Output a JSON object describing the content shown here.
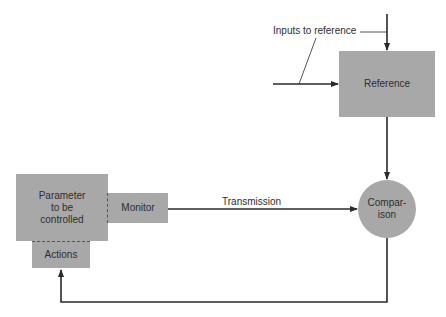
{
  "diagram": {
    "title": "",
    "colors": {
      "node_fill": "#a8a8a8",
      "line": "#2a2a2a",
      "text": "#2e2e2e",
      "background": "#ffffff"
    },
    "nodes": {
      "reference": {
        "label": "Reference",
        "shape": "rectangle"
      },
      "comparison": {
        "label": "Compar-\nison",
        "line1": "Compar-",
        "line2": "ison",
        "shape": "circle"
      },
      "parameter": {
        "label": "Parameter to be controlled",
        "line1": "Parameter",
        "line2": "to be",
        "line3": "controlled",
        "shape": "rectangle"
      },
      "monitor": {
        "label": "Monitor",
        "shape": "rectangle"
      },
      "actions": {
        "label": "Actions",
        "shape": "rectangle"
      }
    },
    "labels": {
      "inputs": "Inputs to reference",
      "transmission": "Transmission"
    },
    "edges": [
      {
        "from": "external-input-top",
        "to": "reference",
        "label": ""
      },
      {
        "from": "external-input-left",
        "to": "reference",
        "label": ""
      },
      {
        "from": "reference",
        "to": "comparison",
        "label": ""
      },
      {
        "from": "monitor",
        "to": "comparison",
        "label": "Transmission"
      },
      {
        "from": "comparison",
        "to": "actions",
        "label": ""
      }
    ]
  }
}
